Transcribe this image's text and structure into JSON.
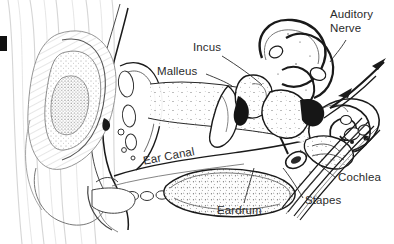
{
  "diagram": {
    "type": "anatomical-line-drawing",
    "background_color": "#ffffff",
    "ink_color": "#1a1a1a",
    "label_color": "#2b2b2b",
    "width": 394,
    "height": 244,
    "corner_mark": {
      "name": "black-edge-mark",
      "color": "#111111",
      "x": 0,
      "y": 36,
      "w": 7,
      "h": 15
    }
  },
  "labels": [
    {
      "id": "auditory-nerve",
      "text": "Auditory\nNerve",
      "x": 330,
      "y": 8,
      "rotation": 0,
      "leader": {
        "from": [
          346,
          40
        ],
        "to": [
          330,
          62
        ]
      }
    },
    {
      "id": "incus",
      "text": "Incus",
      "x": 193,
      "y": 41,
      "rotation": 0,
      "leader": {
        "from": [
          222,
          56
        ],
        "to": [
          262,
          85
        ]
      }
    },
    {
      "id": "malleus",
      "text": "Malleus",
      "x": 157,
      "y": 65,
      "rotation": 0,
      "leader": {
        "from": [
          206,
          74
        ],
        "to": [
          232,
          86
        ]
      }
    },
    {
      "id": "ear-canal",
      "text": "Ear Canal",
      "x": 142,
      "y": 155,
      "rotation": -11,
      "leader": null
    },
    {
      "id": "eardrum",
      "text": "Eardrum",
      "x": 217,
      "y": 204,
      "rotation": 0,
      "leader": {
        "from": [
          244,
          203
        ],
        "to": [
          254,
          168
        ]
      }
    },
    {
      "id": "cochlea",
      "text": "Cochlea",
      "x": 338,
      "y": 171,
      "rotation": 0,
      "leader": {
        "from": [
          336,
          178
        ],
        "to": [
          300,
          150
        ]
      }
    },
    {
      "id": "stapes",
      "text": "Stapes",
      "x": 305,
      "y": 194,
      "rotation": 0,
      "leader": {
        "from": [
          303,
          198
        ],
        "to": [
          283,
          168
        ]
      }
    }
  ],
  "structures": [
    {
      "id": "pinna",
      "name": "outer-ear-pinna"
    },
    {
      "id": "ear-canal-tube",
      "name": "external-auditory-canal"
    },
    {
      "id": "tympanic-membrane",
      "name": "eardrum-membrane"
    },
    {
      "id": "ossicles",
      "name": "middle-ear-ossicles"
    },
    {
      "id": "semicircular",
      "name": "semicircular-canals"
    },
    {
      "id": "cochlea-spiral",
      "name": "cochlea-spiral"
    },
    {
      "id": "nerve-bundle",
      "name": "auditory-nerve-bundle"
    }
  ]
}
